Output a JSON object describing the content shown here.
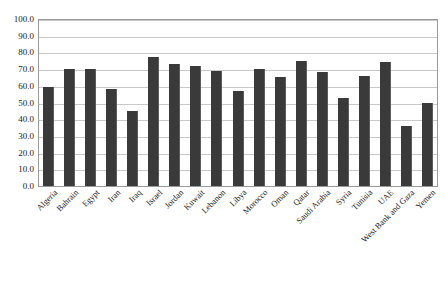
{
  "chart_data": {
    "type": "bar",
    "title": "",
    "subtitle": "",
    "xlabel": "",
    "ylabel": "",
    "ylim": [
      0,
      100
    ],
    "grid": true,
    "legend": "none",
    "y_ticks": [
      "100.0",
      "90.0",
      "80.0",
      "70.0",
      "60.0",
      "50.0",
      "40.0",
      "30.0",
      "20.0",
      "10.0",
      "0.0"
    ],
    "y_tick_values": [
      100,
      90,
      80,
      70,
      60,
      50,
      40,
      30,
      20,
      10,
      0
    ],
    "categories": [
      "Algeria",
      "Bahrain",
      "Egypt",
      "Iran",
      "Iraq",
      "Israel",
      "Jordan",
      "Kuwait",
      "Lebanon",
      "Libya",
      "Morocco",
      "Oman",
      "Qatar",
      "Saudi Arabia",
      "Syria",
      "Tunisia",
      "UAE",
      "West Bank and Gaza",
      "Yemen"
    ],
    "values": [
      59,
      70,
      70,
      58,
      45,
      77,
      73,
      72,
      69,
      57,
      70,
      65,
      75,
      68,
      53,
      66,
      74,
      36,
      50
    ],
    "series": [
      {
        "name": "series-1",
        "color": "#3a3a3a",
        "values": [
          59,
          70,
          70,
          58,
          45,
          77,
          73,
          72,
          69,
          57,
          70,
          65,
          75,
          68,
          53,
          66,
          74,
          36,
          50
        ]
      }
    ]
  },
  "style": {
    "bar_color": "#3a3a3a",
    "bar_edge_color": "#5d5d5d",
    "gridline_color": "#c9c9c9",
    "frame_color": "#9a9a9a",
    "background": "#ffffff",
    "text_color": "#1a1a1a"
  }
}
